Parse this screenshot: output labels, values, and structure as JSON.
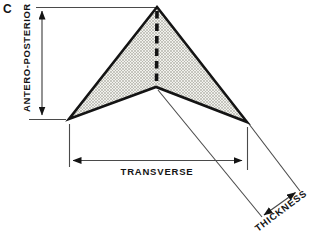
{
  "figure": {
    "panel_label": "C"
  },
  "labels": {
    "antero_posterior": "ANTERO-POSTERIOR",
    "transverse": "TRANSVERSE",
    "thickness": "THICKNESS"
  },
  "colors": {
    "outline": "#141414",
    "dimension_line": "#4a4a4a",
    "text": "#141414",
    "hatch_background": "#f1f1ed",
    "hatch_line": "#a3a39b",
    "background": "#ffffff"
  }
}
